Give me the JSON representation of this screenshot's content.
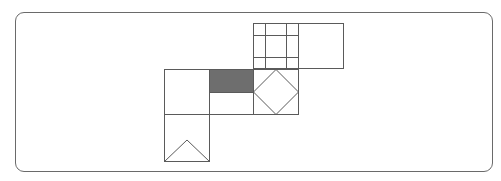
{
  "diagram": {
    "title": "",
    "colors": {
      "stroke": "#5a5a5a",
      "fill_shaded": "#6e6e6e",
      "background": "#ffffff",
      "frame": "#6a6a6a"
    },
    "cells": [
      {
        "name": "grid-square",
        "x": 253,
        "y": 23,
        "w": 45,
        "h": 46,
        "pattern": "grid",
        "v_lines": [
          265,
          286
        ],
        "h_lines": [
          35,
          57
        ]
      },
      {
        "name": "blank-square-top-right",
        "x": 298,
        "y": 23,
        "w": 46,
        "h": 46,
        "pattern": "none"
      },
      {
        "name": "blank-square-left",
        "x": 164,
        "y": 69,
        "w": 45,
        "h": 46,
        "pattern": "none"
      },
      {
        "name": "half-shaded-square",
        "x": 209,
        "y": 69,
        "w": 44,
        "h": 46,
        "pattern": "top-half-shaded"
      },
      {
        "name": "diamond-square",
        "x": 253,
        "y": 69,
        "w": 45,
        "h": 46,
        "pattern": "inscribed-diamond"
      },
      {
        "name": "triangle-square",
        "x": 164,
        "y": 115,
        "w": 45,
        "h": 47,
        "pattern": "triangle"
      }
    ]
  }
}
